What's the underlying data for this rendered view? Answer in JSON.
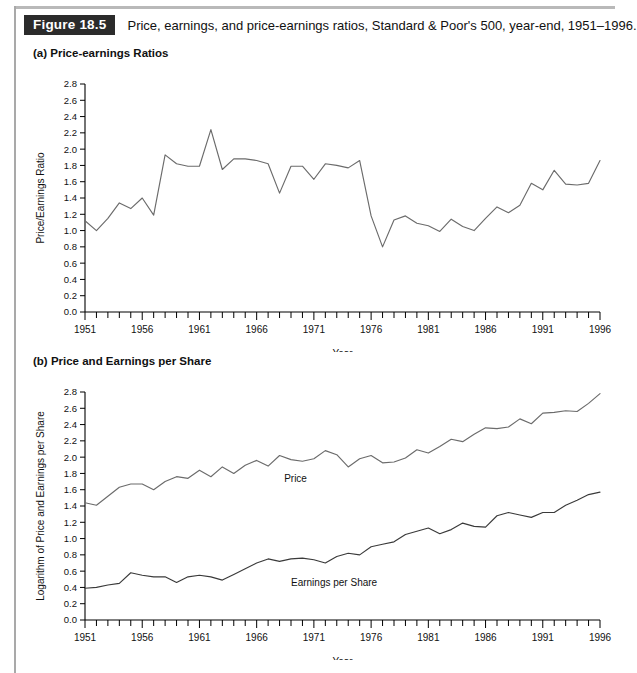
{
  "figure": {
    "tag": "Figure 18.5",
    "caption": "Price, earnings, and price-earnings ratios, Standard & Poor's 500, year-end, 1951–1996."
  },
  "panels": {
    "a": {
      "title": "(a) Price-earnings Ratios"
    },
    "b": {
      "title": "(b) Price and Earnings per Share"
    }
  },
  "colors": {
    "axis": "#000000",
    "pe_line": "#6b6b6b",
    "price_line": "#6b6b6b",
    "earnings_line": "#3a3a3a",
    "tag_background": "#2b2b2b",
    "tag_text": "#ffffff",
    "page_background": "#ffffff"
  },
  "chart_data": [
    {
      "id": "price-earnings-ratios",
      "type": "line",
      "title": "(a) Price-earnings Ratios",
      "xlabel": "Year",
      "ylabel": "Price/Earnings Ratio",
      "xlim": [
        1951,
        1996
      ],
      "ylim": [
        0.0,
        2.8
      ],
      "ytick_labels": [
        "0.0",
        "0.2",
        "0.4",
        "0.6",
        "0.8",
        "1.0",
        "1.2",
        "1.4",
        "1.6",
        "1.8",
        "2.0",
        "2.2",
        "2.4",
        "2.6",
        "2.8"
      ],
      "yticks": [
        0.0,
        0.2,
        0.4,
        0.6,
        0.8,
        1.0,
        1.2,
        1.4,
        1.6,
        1.8,
        2.0,
        2.2,
        2.4,
        2.6,
        2.8
      ],
      "xtick_labels": [
        "1951",
        "1956",
        "1961",
        "1966",
        "1971",
        "1976",
        "1981",
        "1986",
        "1991",
        "1996"
      ],
      "xticks": [
        1951,
        1956,
        1961,
        1966,
        1971,
        1976,
        1981,
        1986,
        1991,
        1996
      ],
      "grid": false,
      "legend": "none",
      "x": [
        1951,
        1952,
        1953,
        1954,
        1955,
        1956,
        1957,
        1958,
        1959,
        1960,
        1961,
        1962,
        1963,
        1964,
        1965,
        1966,
        1967,
        1968,
        1969,
        1970,
        1971,
        1972,
        1973,
        1974,
        1975,
        1976,
        1977,
        1978,
        1979,
        1980,
        1981,
        1982,
        1983,
        1984,
        1985,
        1986,
        1987,
        1988,
        1989,
        1990,
        1991,
        1992,
        1993,
        1994,
        1995,
        1996
      ],
      "series": [
        {
          "name": "Price/Earnings Ratio",
          "values": [
            1.12,
            1.0,
            1.15,
            1.34,
            1.27,
            1.4,
            1.19,
            1.93,
            1.82,
            1.79,
            1.79,
            2.24,
            1.75,
            1.88,
            1.88,
            1.86,
            1.82,
            1.46,
            1.79,
            1.79,
            1.63,
            1.82,
            1.8,
            1.77,
            1.86,
            1.18,
            0.8,
            1.13,
            1.18,
            1.09,
            1.06,
            0.99,
            1.14,
            1.05,
            1.0,
            1.15,
            1.29,
            1.22,
            1.31,
            1.58,
            1.5,
            1.74,
            1.57,
            1.56,
            1.58,
            1.86
          ],
          "color": "#6b6b6b"
        }
      ]
    },
    {
      "id": "price-and-earnings-per-share",
      "type": "line",
      "title": "(b) Price and Earnings per Share",
      "xlabel": "Year",
      "ylabel": "Logarithm of Price and Earnings per Share",
      "xlim": [
        1951,
        1996
      ],
      "ylim": [
        0.0,
        2.8
      ],
      "ytick_labels": [
        "0.0",
        "0.2",
        "0.4",
        "0.6",
        "0.8",
        "1.0",
        "1.2",
        "1.4",
        "1.6",
        "1.8",
        "2.0",
        "2.2",
        "2.4",
        "2.6",
        "2.8"
      ],
      "yticks": [
        0.0,
        0.2,
        0.4,
        0.6,
        0.8,
        1.0,
        1.2,
        1.4,
        1.6,
        1.8,
        2.0,
        2.2,
        2.4,
        2.6,
        2.8
      ],
      "xtick_labels": [
        "1951",
        "1956",
        "1961",
        "1966",
        "1971",
        "1976",
        "1981",
        "1986",
        "1991",
        "1996"
      ],
      "xticks": [
        1951,
        1956,
        1961,
        1966,
        1971,
        1976,
        1981,
        1986,
        1991,
        1996
      ],
      "grid": false,
      "legend": "inline",
      "x": [
        1951,
        1952,
        1953,
        1954,
        1955,
        1956,
        1957,
        1958,
        1959,
        1960,
        1961,
        1962,
        1963,
        1964,
        1965,
        1966,
        1967,
        1968,
        1969,
        1970,
        1971,
        1972,
        1973,
        1974,
        1975,
        1976,
        1977,
        1978,
        1979,
        1980,
        1981,
        1982,
        1983,
        1984,
        1985,
        1986,
        1987,
        1988,
        1989,
        1990,
        1991,
        1992,
        1993,
        1994,
        1995,
        1996
      ],
      "series": [
        {
          "name": "Price",
          "label": "Price",
          "label_x": 1968.4,
          "label_y": 1.7,
          "values": [
            1.44,
            1.41,
            1.52,
            1.63,
            1.67,
            1.67,
            1.6,
            1.7,
            1.76,
            1.74,
            1.84,
            1.76,
            1.88,
            1.8,
            1.9,
            1.96,
            1.89,
            2.02,
            1.97,
            1.95,
            1.98,
            2.08,
            2.03,
            1.88,
            1.98,
            2.02,
            1.93,
            1.94,
            1.99,
            2.09,
            2.05,
            2.13,
            2.22,
            2.19,
            2.28,
            2.36,
            2.35,
            2.37,
            2.47,
            2.41,
            2.54,
            2.55,
            2.57,
            2.56,
            2.66,
            2.78
          ],
          "color": "#6b6b6b"
        },
        {
          "name": "Earnings per Share",
          "label": "Earnings per Share",
          "label_x": 1969.0,
          "label_y": 0.42,
          "values": [
            0.39,
            0.4,
            0.43,
            0.45,
            0.58,
            0.55,
            0.53,
            0.53,
            0.46,
            0.53,
            0.55,
            0.53,
            0.49,
            0.56,
            0.63,
            0.7,
            0.75,
            0.72,
            0.75,
            0.76,
            0.74,
            0.7,
            0.78,
            0.82,
            0.8,
            0.9,
            0.93,
            0.96,
            1.05,
            1.09,
            1.13,
            1.06,
            1.11,
            1.19,
            1.15,
            1.14,
            1.28,
            1.32,
            1.29,
            1.26,
            1.32,
            1.32,
            1.41,
            1.47,
            1.54,
            1.57
          ],
          "color": "#3a3a3a"
        }
      ]
    }
  ]
}
